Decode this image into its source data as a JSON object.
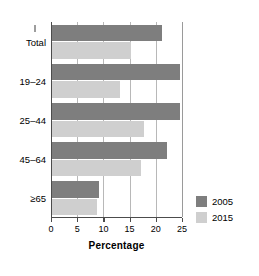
{
  "chart_data": {
    "type": "bar",
    "orientation": "horizontal",
    "title": "",
    "xlabel": "Percentage",
    "ylabel": "",
    "xlim": [
      0,
      25
    ],
    "xticks": [
      0,
      5,
      10,
      15,
      20,
      25
    ],
    "grid": "vertical",
    "legend_position": "right-bottom",
    "categories": [
      "Total",
      "19–24",
      "25–44",
      "45–64",
      "≥65"
    ],
    "series": [
      {
        "name": "2005",
        "color": "#7e7e7e",
        "values": [
          21,
          24.5,
          24.5,
          22,
          9
        ]
      },
      {
        "name": "2015",
        "color": "#cfcfcf",
        "values": [
          15,
          13,
          17.5,
          17,
          8.5
        ]
      }
    ]
  },
  "axis": {
    "x_tick_labels": [
      "0",
      "5",
      "10",
      "15",
      "20",
      "25"
    ],
    "x_title": "Percentage"
  },
  "legend": {
    "items": [
      {
        "label": "2005",
        "color": "#7e7e7e"
      },
      {
        "label": "2015",
        "color": "#cfcfcf"
      }
    ]
  },
  "colors": {
    "series_2005": "#7e7e7e",
    "series_2015": "#cfcfcf",
    "axis": "#4c4c4c",
    "grid": "#b8b8b8",
    "background": "#ffffff"
  }
}
